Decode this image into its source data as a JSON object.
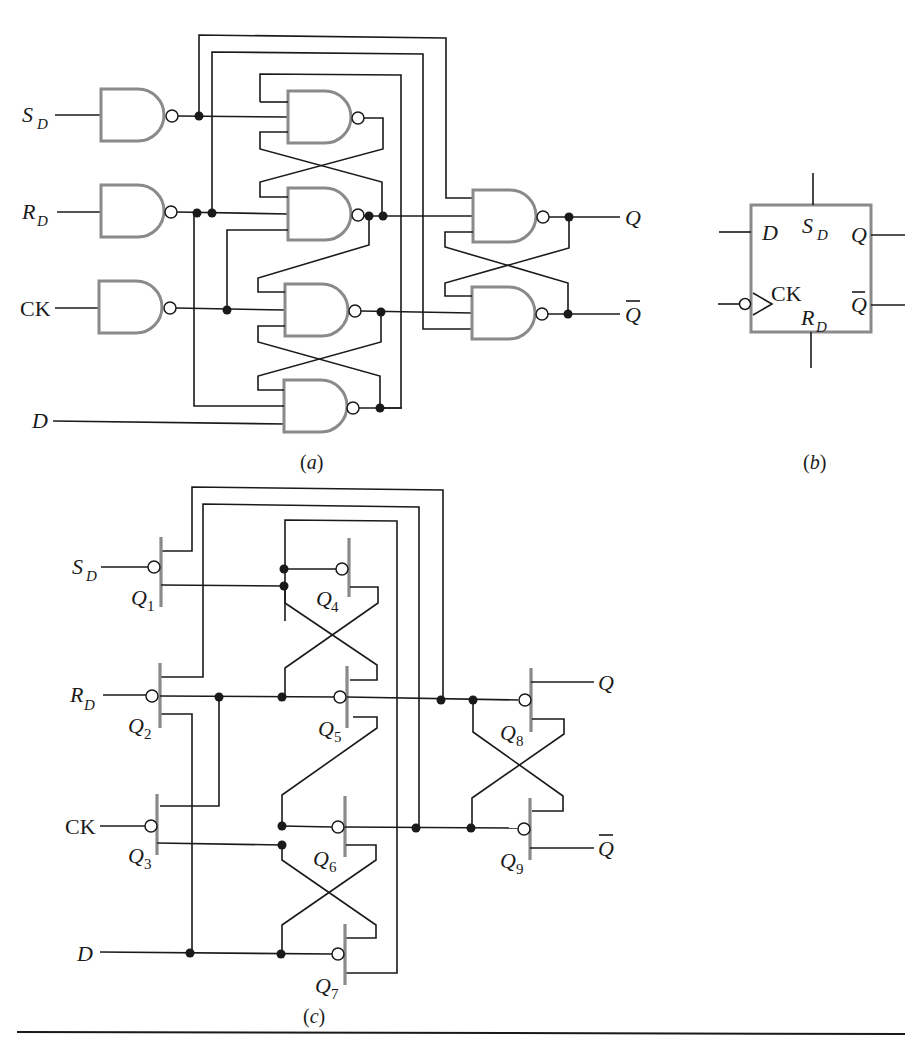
{
  "figure": {
    "colors": {
      "wire": "#1a1a1a",
      "device_outline": "#8a8a8a",
      "background": "#ffffff"
    }
  },
  "panel_a": {
    "caption_open": "(",
    "caption": "a",
    "caption_close": ")",
    "inputs": [
      {
        "main": "S",
        "sub": "D"
      },
      {
        "main": "R",
        "sub": "D"
      },
      {
        "main": "CK",
        "sub": ""
      },
      {
        "main": "D",
        "sub": ""
      }
    ],
    "outputs": [
      {
        "main": "Q",
        "bar": false
      },
      {
        "main": "Q",
        "bar": true
      }
    ],
    "gate_count": 9,
    "gate_type": "NAND"
  },
  "panel_b": {
    "caption_open": "(",
    "caption": "b",
    "caption_close": ")",
    "pins": {
      "d": "D",
      "sd_main": "S",
      "sd_sub": "D",
      "q": "Q",
      "qbar": "Q",
      "ck": "CK",
      "rd_main": "R",
      "rd_sub": "D"
    }
  },
  "panel_c": {
    "caption_open": "(",
    "caption": "c",
    "caption_close": ")",
    "inputs": [
      {
        "main": "S",
        "sub": "D"
      },
      {
        "main": "R",
        "sub": "D"
      },
      {
        "main": "CK",
        "sub": ""
      },
      {
        "main": "D",
        "sub": ""
      }
    ],
    "outputs": [
      {
        "main": "Q",
        "bar": false
      },
      {
        "main": "Q",
        "bar": true
      }
    ],
    "transistors": [
      {
        "main": "Q",
        "sub": "1"
      },
      {
        "main": "Q",
        "sub": "2"
      },
      {
        "main": "Q",
        "sub": "3"
      },
      {
        "main": "Q",
        "sub": "4"
      },
      {
        "main": "Q",
        "sub": "5"
      },
      {
        "main": "Q",
        "sub": "6"
      },
      {
        "main": "Q",
        "sub": "7"
      },
      {
        "main": "Q",
        "sub": "8"
      },
      {
        "main": "Q",
        "sub": "9"
      }
    ]
  }
}
